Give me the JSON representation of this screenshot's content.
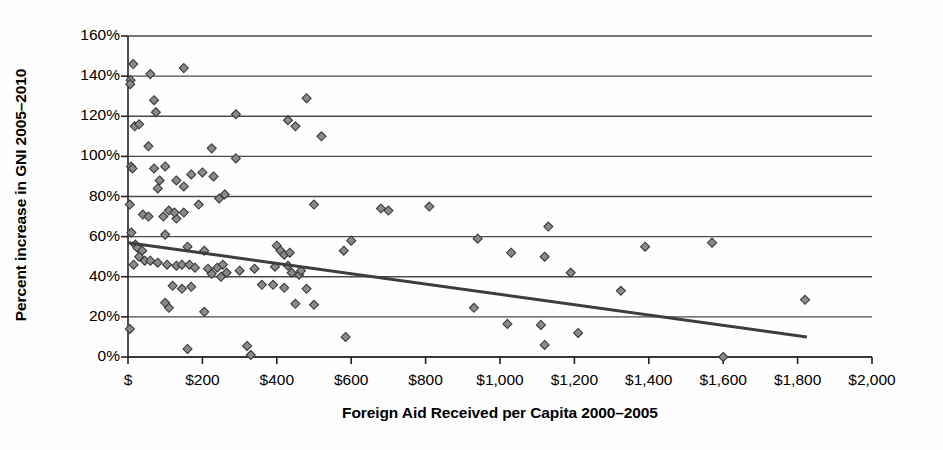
{
  "chart_data": {
    "type": "scatter",
    "title": "",
    "xlabel": "Foreign Aid Received per Capita 2000–2005",
    "ylabel": "Percent increase in GNI 2005–2010",
    "xlim": [
      0,
      2000
    ],
    "ylim": [
      0,
      1.6
    ],
    "grid": true,
    "legend": "none",
    "xtick_labels": [
      "$",
      "$200",
      "$400",
      "$600",
      "$800",
      "$1,000",
      "$1,200",
      "$1,400",
      "$1,600",
      "$1,800",
      "$2,000"
    ],
    "xtick_values": [
      0,
      200,
      400,
      600,
      800,
      1000,
      1200,
      1400,
      1600,
      1800,
      2000
    ],
    "ytick_labels": [
      "0%",
      "20%",
      "40%",
      "60%",
      "80%",
      "100%",
      "120%",
      "140%",
      "160%"
    ],
    "ytick_values": [
      0,
      0.2,
      0.4,
      0.6,
      0.8,
      1.0,
      1.2,
      1.4,
      1.6
    ],
    "marker": {
      "shape": "diamond",
      "fill": "#8a8a8a",
      "stroke": "#3a3a3a",
      "size": 9
    },
    "trendline": {
      "color": "#3d3d3d",
      "width": 3,
      "x": [
        0,
        1825
      ],
      "y": [
        0.57,
        0.1
      ]
    },
    "axis_color": "#222222",
    "grid_color": "#4a4a4a",
    "series": [
      {
        "name": "Countries",
        "points": [
          [
            14,
            1.46
          ],
          [
            7,
            1.38
          ],
          [
            6,
            1.36
          ],
          [
            60,
            1.41
          ],
          [
            150,
            1.44
          ],
          [
            18,
            1.15
          ],
          [
            30,
            1.16
          ],
          [
            70,
            1.28
          ],
          [
            75,
            1.22
          ],
          [
            290,
            1.21
          ],
          [
            480,
            1.29
          ],
          [
            430,
            1.18
          ],
          [
            450,
            1.15
          ],
          [
            520,
            1.1
          ],
          [
            55,
            1.05
          ],
          [
            225,
            1.04
          ],
          [
            8,
            0.95
          ],
          [
            12,
            0.94
          ],
          [
            70,
            0.94
          ],
          [
            100,
            0.95
          ],
          [
            290,
            0.99
          ],
          [
            170,
            0.91
          ],
          [
            85,
            0.88
          ],
          [
            130,
            0.88
          ],
          [
            200,
            0.92
          ],
          [
            230,
            0.9
          ],
          [
            80,
            0.84
          ],
          [
            150,
            0.85
          ],
          [
            245,
            0.79
          ],
          [
            260,
            0.81
          ],
          [
            5,
            0.76
          ],
          [
            110,
            0.73
          ],
          [
            150,
            0.72
          ],
          [
            190,
            0.76
          ],
          [
            680,
            0.74
          ],
          [
            700,
            0.73
          ],
          [
            810,
            0.75
          ],
          [
            500,
            0.76
          ],
          [
            40,
            0.71
          ],
          [
            55,
            0.7
          ],
          [
            95,
            0.7
          ],
          [
            130,
            0.69
          ],
          [
            125,
            0.72
          ],
          [
            9,
            0.62
          ],
          [
            100,
            0.61
          ],
          [
            600,
            0.58
          ],
          [
            940,
            0.59
          ],
          [
            1130,
            0.65
          ],
          [
            1390,
            0.55
          ],
          [
            1570,
            0.57
          ],
          [
            1120,
            0.5
          ],
          [
            20,
            0.56
          ],
          [
            25,
            0.545
          ],
          [
            38,
            0.53
          ],
          [
            160,
            0.55
          ],
          [
            205,
            0.53
          ],
          [
            400,
            0.555
          ],
          [
            410,
            0.53
          ],
          [
            420,
            0.51
          ],
          [
            435,
            0.52
          ],
          [
            1030,
            0.52
          ],
          [
            1190,
            0.42
          ],
          [
            30,
            0.5
          ],
          [
            45,
            0.48
          ],
          [
            60,
            0.48
          ],
          [
            15,
            0.46
          ],
          [
            80,
            0.47
          ],
          [
            105,
            0.46
          ],
          [
            130,
            0.455
          ],
          [
            145,
            0.46
          ],
          [
            165,
            0.46
          ],
          [
            180,
            0.445
          ],
          [
            215,
            0.44
          ],
          [
            240,
            0.445
          ],
          [
            255,
            0.46
          ],
          [
            300,
            0.43
          ],
          [
            340,
            0.44
          ],
          [
            395,
            0.45
          ],
          [
            430,
            0.455
          ],
          [
            440,
            0.42
          ],
          [
            460,
            0.41
          ],
          [
            465,
            0.43
          ],
          [
            580,
            0.53
          ],
          [
            930,
            0.245
          ],
          [
            1020,
            0.165
          ],
          [
            1325,
            0.33
          ],
          [
            225,
            0.415
          ],
          [
            250,
            0.4
          ],
          [
            265,
            0.42
          ],
          [
            120,
            0.355
          ],
          [
            145,
            0.34
          ],
          [
            170,
            0.35
          ],
          [
            360,
            0.36
          ],
          [
            390,
            0.36
          ],
          [
            420,
            0.345
          ],
          [
            480,
            0.34
          ],
          [
            1110,
            0.16
          ],
          [
            1210,
            0.12
          ],
          [
            1120,
            0.06
          ],
          [
            100,
            0.27
          ],
          [
            110,
            0.245
          ],
          [
            205,
            0.225
          ],
          [
            450,
            0.265
          ],
          [
            500,
            0.26
          ],
          [
            1820,
            0.285
          ],
          [
            5,
            0.14
          ],
          [
            160,
            0.04
          ],
          [
            320,
            0.055
          ],
          [
            330,
            0.01
          ],
          [
            585,
            0.1
          ],
          [
            1600,
            0.0
          ]
        ]
      }
    ]
  }
}
